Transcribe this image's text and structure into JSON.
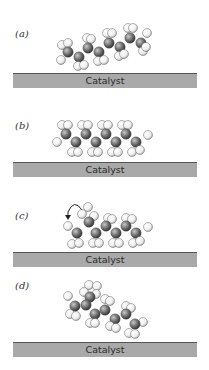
{
  "figure": {
    "panels": [
      {
        "label": "(a)",
        "substrate_label": "Catalyst",
        "state": "approaching, tilted"
      },
      {
        "label": "(b)",
        "substrate_label": "Catalyst",
        "state": "adsorbed flat"
      },
      {
        "label": "(c)",
        "substrate_label": "Catalyst",
        "state": "adsorbed, end group rotating",
        "annotation": "curved-arrow"
      },
      {
        "label": "(d)",
        "substrate_label": "Catalyst",
        "state": "desorbed, isomerized"
      }
    ],
    "colors": {
      "carbon": "#6e6e6e",
      "hydrogen": "#eeeeee",
      "atom_outline": "#444444",
      "catalyst_fill": "#a9a9a9",
      "catalyst_edge": "#555555"
    }
  }
}
